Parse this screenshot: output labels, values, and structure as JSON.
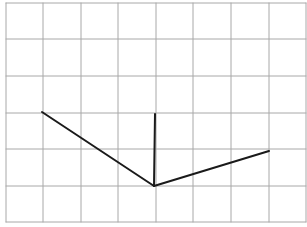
{
  "diagram": {
    "type": "grid-line-drawing",
    "colors": {
      "background": "#ffffff",
      "grid": "#a8a8a8",
      "stroke": "#1a1a1a"
    },
    "grid": {
      "columns": 8,
      "rows": 6,
      "vertical_lines_x": [
        6,
        43,
        81,
        118,
        156,
        193,
        231,
        269,
        306
      ],
      "horizontal_lines_y": [
        3,
        39,
        76,
        113,
        149,
        186,
        222
      ],
      "left": 6,
      "right": 306,
      "top": 3,
      "bottom": 222
    },
    "segments": [
      {
        "name": "left-arm",
        "x1": 42,
        "y1": 112,
        "x2": 154,
        "y2": 186
      },
      {
        "name": "vertical-arm",
        "x1": 155,
        "y1": 114,
        "x2": 154,
        "y2": 186
      },
      {
        "name": "right-arm",
        "x1": 154,
        "y1": 186,
        "x2": 269,
        "y2": 151
      }
    ]
  }
}
